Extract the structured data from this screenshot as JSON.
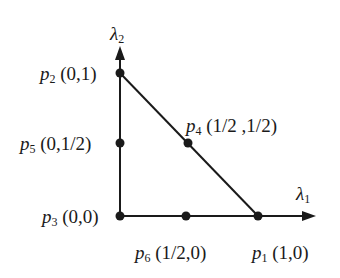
{
  "diagram": {
    "type": "triangle-reference-element",
    "axes": {
      "x": {
        "symbol": "λ",
        "sub": "1"
      },
      "y": {
        "symbol": "λ",
        "sub": "2"
      }
    },
    "points": [
      {
        "id": "p1",
        "name": "p",
        "sub": "1",
        "coords": "(1,0)"
      },
      {
        "id": "p2",
        "name": "p",
        "sub": "2",
        "coords": "(0,1)"
      },
      {
        "id": "p3",
        "name": "p",
        "sub": "3",
        "coords": "(0,0)"
      },
      {
        "id": "p4",
        "name": "p",
        "sub": "4",
        "coords": "(1/2 ,1/2)"
      },
      {
        "id": "p5",
        "name": "p",
        "sub": "5",
        "coords": "(0,1/2)"
      },
      {
        "id": "p6",
        "name": "p",
        "sub": "6",
        "coords": "(1/2,0)"
      }
    ],
    "colors": {
      "line": "#1a1a1a",
      "background": "#ffffff"
    }
  }
}
